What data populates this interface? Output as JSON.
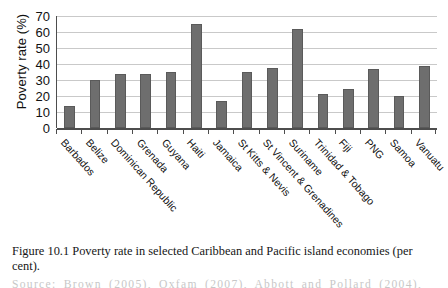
{
  "chart_data": {
    "type": "bar",
    "title": "",
    "xlabel": "",
    "ylabel": "Poverty rate (%)",
    "ylim": [
      0,
      70
    ],
    "yticks": [
      70,
      60,
      50,
      40,
      30,
      20,
      10,
      0
    ],
    "grid": true,
    "legend": "none",
    "bar_color": "#6e6e6e",
    "categories": [
      "Barbados",
      "Belize",
      "Dominican Republic",
      "Grenada",
      "Guyana",
      "Haiti",
      "Jamaica",
      "St Kitts & Nevis",
      "St Vincent & Grenadines",
      "Suriname",
      "Trinidad & Tobago",
      "Fiji",
      "PNG",
      "Samoa",
      "Vanuatu"
    ],
    "values": [
      14,
      30,
      34,
      34,
      35,
      65,
      17,
      35,
      37.5,
      62,
      21,
      24.5,
      37,
      20,
      39
    ]
  },
  "caption": {
    "label": "Figure 10.1",
    "text": "Poverty rate in selected Caribbean and Pacific island economies (per cent)."
  },
  "source": {
    "text": "Source: Brown (2005), Oxfam (2007), Abbott and Pollard (2004), UNDP i"
  }
}
